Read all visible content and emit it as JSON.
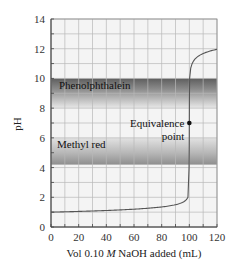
{
  "chart_data": {
    "type": "line",
    "title": "",
    "xlabel": "Vol 0.10 M NaOH added (mL)",
    "xlabel_parts": [
      "Vol 0.10 ",
      "M",
      " NaOH added (mL)"
    ],
    "ylabel": "pH",
    "xlim": [
      0,
      120
    ],
    "ylim": [
      0,
      14
    ],
    "x_ticks": [
      0,
      20,
      40,
      60,
      80,
      100,
      120
    ],
    "y_ticks": [
      0,
      2,
      4,
      6,
      8,
      10,
      12,
      14
    ],
    "grid": true,
    "grid_x_step": 10,
    "grid_y_step": 1,
    "series": [
      {
        "name": "Titration curve",
        "x": [
          0,
          10,
          20,
          30,
          40,
          50,
          60,
          70,
          80,
          90,
          95,
          98,
          99,
          99.5,
          100,
          100.5,
          101,
          102,
          105,
          110,
          115,
          120
        ],
        "y": [
          1.0,
          1.09,
          1.18,
          1.27,
          1.37,
          1.48,
          1.6,
          1.75,
          1.95,
          2.28,
          2.59,
          3.0,
          3.3,
          3.6,
          7.0,
          10.4,
          10.7,
          11.0,
          11.39,
          11.68,
          11.84,
          11.96
        ],
        "color": "#555555"
      }
    ],
    "bands": [
      {
        "label": "Phenolphthalein",
        "pH_low": 8.0,
        "pH_high": 10.0,
        "dark_at": "top"
      },
      {
        "label": "Methyl red",
        "pH_low": 4.2,
        "pH_high": 6.0,
        "dark_at": "bottom"
      }
    ],
    "annotations": [
      {
        "text_line1": "Equivalence",
        "text_line2": "point",
        "x": 100,
        "y": 7.0
      }
    ]
  },
  "colors": {
    "background": "#ffffff",
    "plot_bg": "#f4f4f4",
    "grid": "#b8b8b8",
    "axis": "#444444",
    "curve": "#555555",
    "band_dark": "#6a6a6a",
    "band_light": "#e6e6e6"
  }
}
